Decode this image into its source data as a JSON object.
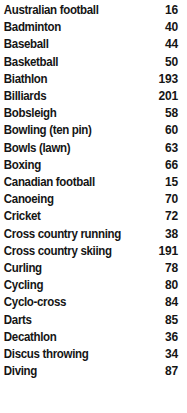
{
  "document": {
    "type": "index-listing",
    "background_color": "#ffffff",
    "text_color": "#151515"
  },
  "index": {
    "entries": [
      {
        "label": "Australian football",
        "value": "16"
      },
      {
        "label": "Badminton",
        "value": "40"
      },
      {
        "label": "Baseball",
        "value": "44"
      },
      {
        "label": "Basketball",
        "value": "50"
      },
      {
        "label": "Biathlon",
        "value": "193"
      },
      {
        "label": "Billiards",
        "value": "201"
      },
      {
        "label": "Bobsleigh",
        "value": "58"
      },
      {
        "label": "Bowling (ten pin)",
        "value": "60"
      },
      {
        "label": "Bowls (lawn)",
        "value": "63"
      },
      {
        "label": "Boxing",
        "value": "66"
      },
      {
        "label": "Canadian football",
        "value": "15"
      },
      {
        "label": "Canoeing",
        "value": "70"
      },
      {
        "label": "Cricket",
        "value": "72"
      },
      {
        "label": "Cross country running",
        "value": "38"
      },
      {
        "label": "Cross country skiing",
        "value": "191"
      },
      {
        "label": "Curling",
        "value": "78"
      },
      {
        "label": "Cycling",
        "value": "80"
      },
      {
        "label": "Cyclo-cross",
        "value": "84"
      },
      {
        "label": "Darts",
        "value": "85"
      },
      {
        "label": "Decathlon",
        "value": "36"
      },
      {
        "label": "Discus throwing",
        "value": "34"
      },
      {
        "label": "Diving",
        "value": "87"
      }
    ]
  }
}
